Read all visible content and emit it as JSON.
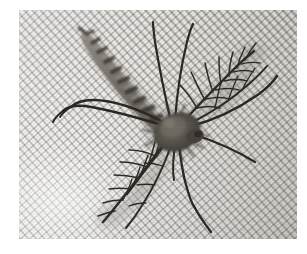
{
  "image": {
    "kind": "photograph",
    "subject": "mosquito",
    "subject_detail": "male mosquito with plumose feathery antennae resting on fine woven mesh netting",
    "color_mode": "grayscale",
    "orientation": "landscape",
    "canvas": {
      "width": 307,
      "height": 254
    },
    "plate": {
      "left": 19,
      "top": 10,
      "width": 278,
      "height": 229
    },
    "border_color": "#ffffff"
  },
  "background": {
    "name": "mesh netting",
    "description": "fine white woven mesh fabric with diagonal square weave",
    "weave_angle_degrees": 48,
    "cell_size_px": 6,
    "highlight_color": "#f6f5f3",
    "midtone_color": "#dedbd6",
    "shadow_color": "#bab7b2",
    "thread_shadow_color": "#7c7974",
    "bright_region": "lower-left",
    "dim_region": "upper-right"
  },
  "subject": {
    "body_color_dark": "#34312d",
    "body_color_mid": "#5d5953",
    "body_color_light": "#8e8a83",
    "shadow_color": "#9d9a95",
    "parts": [
      {
        "name": "abdomen",
        "description": "banded segmented abdomen angled toward upper-left",
        "shade": "#6b655d"
      },
      {
        "name": "thorax",
        "description": "rounded dark central body mass",
        "shade": "#514c45"
      },
      {
        "name": "antenna-left",
        "description": "plumose feathery antenna sweeping to upper-right",
        "shade": "#2e2b27"
      },
      {
        "name": "antenna-right",
        "description": "plumose feathery antenna sweeping to lower-left",
        "shade": "#2e2b27"
      },
      {
        "name": "legs",
        "description": "six long slender dark legs radiating outward",
        "shade": "#26241f"
      }
    ]
  },
  "annotations": {
    "caption": "",
    "labels": [],
    "scale_bar": ""
  }
}
